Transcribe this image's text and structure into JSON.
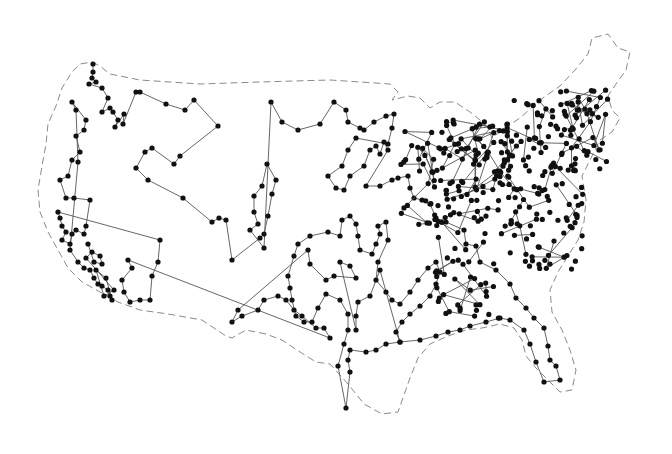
{
  "map": {
    "title": "",
    "style": {
      "outline_color": "#8a8a8a",
      "tour_color": "#555555",
      "city_color": "#111111",
      "background": "#ffffff"
    },
    "outline": "M92,62 L100,66 L110,74 L140,80 L200,84 L260,82 L330,80 L390,84 L398,92 L392,100 L408,96 L420,98 L430,108 L440,102 L455,102 L470,112 L480,120 L488,128 L492,138 L505,128 L520,118 L540,100 L560,86 L575,70 L588,54 L592,38 L608,34 L618,48 L630,52 L626,70 L616,84 L608,96 L612,110 L620,118 L612,132 L600,140 L590,160 L582,176 L586,200 L584,222 L578,240 L568,256 L558,272 L550,290 L552,312 L562,330 L570,350 L576,370 L572,390 L560,392 L548,380 L536,368 L526,356 L522,340 L514,328 L500,324 L482,328 L466,330 L448,336 L430,344 L418,358 L410,378 L398,412 L382,414 L364,404 L348,384 L330,364 L316,362 L300,352 L282,340 L266,334 L246,330 L232,338 L226,336 L202,320 L168,314 L140,310 L118,302 L100,292 L82,282 L68,268 L58,250 L48,232 L40,212 L38,190 L42,166 L46,144 L48,124 L56,106 L62,88 L72,72 L80,64 Z",
    "cities": [
      [
        93,
        64
      ],
      [
        93,
        72
      ],
      [
        92,
        78
      ],
      [
        96,
        82
      ],
      [
        89,
        84
      ],
      [
        102,
        88
      ],
      [
        108,
        98
      ],
      [
        102,
        112
      ],
      [
        110,
        108
      ],
      [
        113,
        112
      ],
      [
        118,
        120
      ],
      [
        115,
        127
      ],
      [
        124,
        114
      ],
      [
        123,
        124
      ],
      [
        136,
        92
      ],
      [
        140,
        92
      ],
      [
        166,
        104
      ],
      [
        185,
        110
      ],
      [
        194,
        100
      ],
      [
        218,
        126
      ],
      [
        180,
        156
      ],
      [
        174,
        164
      ],
      [
        152,
        148
      ],
      [
        145,
        152
      ],
      [
        136,
        168
      ],
      [
        148,
        180
      ],
      [
        183,
        198
      ],
      [
        212,
        222
      ],
      [
        219,
        218
      ],
      [
        226,
        220
      ],
      [
        232,
        260
      ],
      [
        260,
        238
      ],
      [
        264,
        234
      ],
      [
        268,
        216
      ],
      [
        272,
        194
      ],
      [
        276,
        180
      ],
      [
        267,
        164
      ],
      [
        262,
        186
      ],
      [
        254,
        196
      ],
      [
        254,
        212
      ],
      [
        258,
        224
      ],
      [
        250,
        230
      ],
      [
        264,
        248
      ],
      [
        271,
        102
      ],
      [
        282,
        122
      ],
      [
        298,
        130
      ],
      [
        320,
        124
      ],
      [
        334,
        102
      ],
      [
        346,
        110
      ],
      [
        348,
        122
      ],
      [
        360,
        128
      ],
      [
        364,
        130
      ],
      [
        374,
        122
      ],
      [
        386,
        116
      ],
      [
        394,
        114
      ],
      [
        392,
        128
      ],
      [
        388,
        144
      ],
      [
        356,
        138
      ],
      [
        348,
        150
      ],
      [
        342,
        166
      ],
      [
        328,
        176
      ],
      [
        336,
        188
      ],
      [
        344,
        190
      ],
      [
        350,
        176
      ],
      [
        364,
        166
      ],
      [
        370,
        150
      ],
      [
        376,
        146
      ],
      [
        380,
        154
      ],
      [
        384,
        142
      ],
      [
        388,
        150
      ],
      [
        366,
        186
      ],
      [
        380,
        186
      ],
      [
        392,
        180
      ],
      [
        398,
        178
      ],
      [
        408,
        176
      ],
      [
        410,
        188
      ],
      [
        414,
        198
      ],
      [
        422,
        200
      ],
      [
        430,
        204
      ],
      [
        436,
        218
      ],
      [
        446,
        222
      ],
      [
        464,
        230
      ],
      [
        466,
        244
      ],
      [
        476,
        246
      ],
      [
        480,
        262
      ],
      [
        496,
        270
      ],
      [
        510,
        284
      ],
      [
        516,
        298
      ],
      [
        526,
        308
      ],
      [
        534,
        318
      ],
      [
        544,
        328
      ],
      [
        548,
        346
      ],
      [
        550,
        360
      ],
      [
        556,
        366
      ],
      [
        560,
        380
      ],
      [
        544,
        382
      ],
      [
        536,
        362
      ],
      [
        530,
        344
      ],
      [
        524,
        330
      ],
      [
        510,
        320
      ],
      [
        500,
        318
      ],
      [
        486,
        322
      ],
      [
        470,
        326
      ],
      [
        460,
        330
      ],
      [
        448,
        332
      ],
      [
        436,
        336
      ],
      [
        420,
        340
      ],
      [
        400,
        342
      ],
      [
        386,
        344
      ],
      [
        376,
        350
      ],
      [
        366,
        352
      ],
      [
        350,
        350
      ],
      [
        348,
        360
      ],
      [
        350,
        372
      ],
      [
        346,
        408
      ],
      [
        338,
        366
      ],
      [
        344,
        344
      ],
      [
        348,
        330
      ],
      [
        348,
        314
      ],
      [
        340,
        300
      ],
      [
        326,
        294
      ],
      [
        318,
        308
      ],
      [
        312,
        322
      ],
      [
        304,
        322
      ],
      [
        296,
        316
      ],
      [
        292,
        300
      ],
      [
        290,
        288
      ],
      [
        288,
        276
      ],
      [
        294,
        256
      ],
      [
        298,
        244
      ],
      [
        310,
        236
      ],
      [
        328,
        232
      ],
      [
        340,
        236
      ],
      [
        342,
        220
      ],
      [
        350,
        216
      ],
      [
        356,
        224
      ],
      [
        358,
        236
      ],
      [
        360,
        250
      ],
      [
        372,
        254
      ],
      [
        376,
        244
      ],
      [
        380,
        234
      ],
      [
        378,
        226
      ],
      [
        386,
        222
      ],
      [
        388,
        240
      ],
      [
        378,
        262
      ],
      [
        376,
        280
      ],
      [
        386,
        292
      ],
      [
        392,
        300
      ],
      [
        400,
        304
      ],
      [
        410,
        292
      ],
      [
        418,
        280
      ],
      [
        428,
        268
      ],
      [
        436,
        262
      ],
      [
        440,
        272
      ],
      [
        436,
        284
      ],
      [
        430,
        296
      ],
      [
        420,
        306
      ],
      [
        410,
        314
      ],
      [
        402,
        322
      ],
      [
        396,
        332
      ],
      [
        400,
        342
      ],
      [
        380,
        270
      ],
      [
        370,
        296
      ],
      [
        358,
        302
      ],
      [
        356,
        316
      ],
      [
        356,
        330
      ],
      [
        340,
        262
      ],
      [
        350,
        266
      ],
      [
        356,
        278
      ],
      [
        334,
        276
      ],
      [
        326,
        280
      ],
      [
        310,
        264
      ],
      [
        308,
        250
      ],
      [
        238,
        310
      ],
      [
        232,
        322
      ],
      [
        242,
        316
      ],
      [
        258,
        310
      ],
      [
        264,
        300
      ],
      [
        278,
        296
      ],
      [
        286,
        300
      ],
      [
        294,
        310
      ],
      [
        302,
        316
      ],
      [
        316,
        328
      ],
      [
        324,
        328
      ],
      [
        330,
        338
      ],
      [
        128,
        260
      ],
      [
        132,
        268
      ],
      [
        122,
        280
      ],
      [
        124,
        292
      ],
      [
        130,
        302
      ],
      [
        140,
        300
      ],
      [
        150,
        300
      ],
      [
        152,
        276
      ],
      [
        158,
        262
      ],
      [
        160,
        240
      ],
      [
        58,
        212
      ],
      [
        60,
        218
      ],
      [
        62,
        226
      ],
      [
        66,
        232
      ],
      [
        62,
        240
      ],
      [
        70,
        244
      ],
      [
        72,
        234
      ],
      [
        76,
        230
      ],
      [
        84,
        234
      ],
      [
        86,
        226
      ],
      [
        90,
        200
      ],
      [
        74,
        198
      ],
      [
        66,
        198
      ],
      [
        60,
        180
      ],
      [
        68,
        176
      ],
      [
        72,
        160
      ],
      [
        80,
        152
      ],
      [
        76,
        136
      ],
      [
        84,
        130
      ],
      [
        86,
        120
      ],
      [
        72,
        102
      ],
      [
        76,
        110
      ],
      [
        78,
        162
      ],
      [
        70,
        250
      ],
      [
        78,
        262
      ],
      [
        84,
        268
      ],
      [
        90,
        270
      ],
      [
        94,
        278
      ],
      [
        98,
        284
      ],
      [
        102,
        286
      ],
      [
        108,
        290
      ],
      [
        110,
        296
      ],
      [
        112,
        300
      ],
      [
        106,
        278
      ],
      [
        96,
        270
      ],
      [
        104,
        296
      ],
      [
        114,
        290
      ],
      [
        86,
        258
      ],
      [
        92,
        252
      ],
      [
        100,
        256
      ],
      [
        102,
        264
      ],
      [
        94,
        262
      ],
      [
        88,
        244
      ]
    ],
    "east_cluster_center": [
      530,
      200
    ],
    "legend": []
  }
}
